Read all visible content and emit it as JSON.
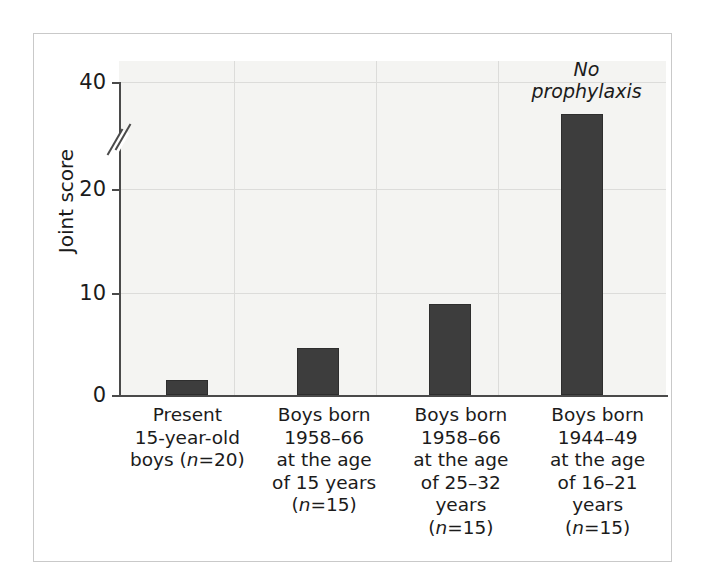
{
  "chart_data": {
    "type": "bar",
    "title": "",
    "subtitle": "",
    "xlabel": "",
    "ylabel": "Joint score",
    "ylim": [
      0,
      40
    ],
    "y_ticks": [
      0,
      10,
      20,
      40
    ],
    "y_axis_break": true,
    "y_axis_break_between": [
      20,
      40
    ],
    "grid": true,
    "grid_axes": "both",
    "legend": false,
    "bar_color": "#3d3d3d",
    "plot_background": "#f4f4f2",
    "categories": [
      "Present 15-year-old boys (n=20)",
      "Boys born 1958–66 at the age of 15 years (n=15)",
      "Boys born 1958–66 at the age of 25–32 years (n=15)",
      "Boys born 1944–49 at the age of 16–21 years (n=15)"
    ],
    "values": [
      1.5,
      4.6,
      8.8,
      34.0
    ],
    "annotations": [
      {
        "text": "No prophylaxis",
        "style": "italic",
        "attached_to_category_index": 3,
        "position": "above-bar"
      }
    ]
  },
  "axis": {
    "y_title": "Joint score",
    "y_ticks": [
      {
        "value": 40,
        "label": "40"
      },
      {
        "value": 20,
        "label": "20"
      },
      {
        "value": 10,
        "label": "10"
      },
      {
        "value": 0,
        "label": "0"
      }
    ]
  },
  "annotation": {
    "no_prophylaxis_line1": "No",
    "no_prophylaxis_line2": "prophylaxis"
  },
  "x_labels": [
    {
      "lines": [
        {
          "pre": "Present",
          "ital": "",
          "post": ""
        },
        {
          "pre": "15-year-old",
          "ital": "",
          "post": ""
        },
        {
          "pre": "boys (",
          "ital": "n",
          "post": "=20)"
        }
      ]
    },
    {
      "lines": [
        {
          "pre": "Boys born",
          "ital": "",
          "post": ""
        },
        {
          "pre": "1958–66",
          "ital": "",
          "post": ""
        },
        {
          "pre": "at the age",
          "ital": "",
          "post": ""
        },
        {
          "pre": "of 15 years",
          "ital": "",
          "post": ""
        },
        {
          "pre": "(",
          "ital": "n",
          "post": "=15)"
        }
      ]
    },
    {
      "lines": [
        {
          "pre": "Boys born",
          "ital": "",
          "post": ""
        },
        {
          "pre": "1958–66",
          "ital": "",
          "post": ""
        },
        {
          "pre": "at the age",
          "ital": "",
          "post": ""
        },
        {
          "pre": "of 25–32",
          "ital": "",
          "post": ""
        },
        {
          "pre": "years",
          "ital": "",
          "post": ""
        },
        {
          "pre": "(",
          "ital": "n",
          "post": "=15)"
        }
      ]
    },
    {
      "lines": [
        {
          "pre": "Boys born",
          "ital": "",
          "post": ""
        },
        {
          "pre": "1944–49",
          "ital": "",
          "post": ""
        },
        {
          "pre": "at the age",
          "ital": "",
          "post": ""
        },
        {
          "pre": "of 16–21",
          "ital": "",
          "post": ""
        },
        {
          "pre": "years",
          "ital": "",
          "post": ""
        },
        {
          "pre": "(",
          "ital": "n",
          "post": "=15)"
        }
      ]
    }
  ],
  "geometry": {
    "baseline_y": 361,
    "tick_y": {
      "t0": 361,
      "t10": 259,
      "t20": 155,
      "t40": 48
    },
    "plot_left": 85,
    "plot_width": 547,
    "bar_width": 42,
    "bar_centers": [
      68,
      199,
      331,
      463
    ]
  }
}
